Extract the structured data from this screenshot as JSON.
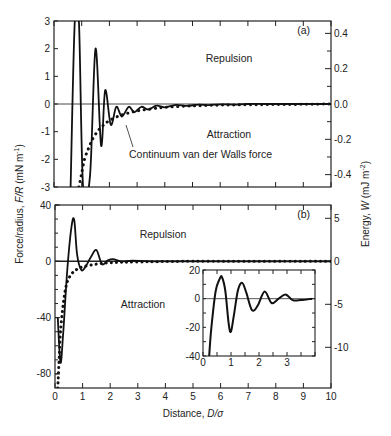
{
  "chart_data": [
    {
      "panel": "(a)",
      "type": "line",
      "xlabel": "Distance, D/σ",
      "ylabel": "Force/radius, F/R (mN m⁻¹)",
      "ylabel_right": "Energy, W (mJ m⁻²)",
      "xlim": [
        0,
        10
      ],
      "ylim": [
        -3,
        3
      ],
      "ylim_right": [
        -0.47,
        0.47
      ],
      "x_ticks": [
        0,
        1,
        2,
        3,
        4,
        5,
        6,
        7,
        8,
        9,
        10
      ],
      "y_ticks": [
        "3",
        "2",
        "1",
        "0",
        "-1",
        "-2",
        "-3"
      ],
      "y_ticks_right": [
        "0.4",
        "0.2",
        "0.0",
        "-0.2",
        "-0.4"
      ],
      "annotations": [
        "Repulsion",
        "Attraction",
        "Continuum van der Walls force"
      ],
      "series": [
        {
          "name": "Oscillatory solvation force",
          "style": "solid",
          "x": [
            0.6,
            0.75,
            0.9,
            1.05,
            1.3,
            1.5,
            1.7,
            1.85,
            2.05,
            2.25,
            2.45,
            2.7,
            2.9,
            3.15,
            3.4,
            3.7,
            4.0,
            4.4,
            4.8,
            5.2,
            5.6,
            6.0,
            6.5,
            7.0,
            8.0,
            9.0,
            10.0
          ],
          "y": [
            -3,
            3,
            3,
            -3,
            -2.6,
            2.0,
            -1.5,
            0.5,
            -0.75,
            -0.1,
            -0.45,
            -0.1,
            -0.3,
            -0.1,
            -0.2,
            -0.06,
            -0.12,
            -0.03,
            -0.07,
            -0.02,
            -0.04,
            -0.01,
            -0.02,
            0,
            0,
            0,
            0
          ]
        },
        {
          "name": "Continuum van der Walls force",
          "style": "dotted",
          "x": [
            0.9,
            1.0,
            1.1,
            1.25,
            1.4,
            1.6,
            1.8,
            2.0,
            2.3,
            2.6,
            3.0,
            3.5,
            4.0,
            5.0,
            6.0,
            7.0,
            8.0,
            9.0,
            10.0
          ],
          "y": [
            -3.0,
            -2.5,
            -2.0,
            -1.6,
            -1.25,
            -0.95,
            -0.75,
            -0.6,
            -0.45,
            -0.35,
            -0.25,
            -0.18,
            -0.12,
            -0.07,
            -0.04,
            -0.03,
            -0.02,
            -0.01,
            0
          ]
        }
      ]
    },
    {
      "panel": "(b)",
      "type": "line",
      "xlabel": "Distance, D/σ",
      "ylabel": "Force/radius, F/R (mN m⁻¹)",
      "ylabel_right": "Energy, W (mJ m⁻²)",
      "xlim": [
        0,
        10
      ],
      "ylim": [
        -90,
        40
      ],
      "x_ticks": [
        0,
        1,
        2,
        3,
        4,
        5,
        6,
        7,
        8,
        9,
        10
      ],
      "y_ticks": [
        "40",
        "0",
        "-40",
        "-80"
      ],
      "y_ticks_right": [
        "5",
        "0",
        "-5",
        "-10"
      ],
      "annotations": [
        "Repulsion",
        "Attraction"
      ],
      "series": [
        {
          "name": "Oscillatory force (total)",
          "style": "solid",
          "x": [
            0.1,
            0.2,
            0.3,
            0.45,
            0.6,
            0.7,
            0.8,
            0.95,
            1.1,
            1.3,
            1.5,
            1.7,
            1.9,
            2.1,
            2.4,
            2.8,
            3.5,
            5.0,
            10.0
          ],
          "y": [
            -40,
            -72,
            -50,
            -5,
            25,
            29,
            5,
            -6,
            -4,
            3,
            8,
            -2,
            0.5,
            1.5,
            0,
            0.5,
            0,
            0,
            0
          ]
        },
        {
          "name": "Continuum van der Walls force",
          "style": "dotted",
          "x": [
            0.1,
            0.15,
            0.2,
            0.3,
            0.4,
            0.5,
            0.7,
            1.0,
            1.5,
            2.0,
            3.0,
            5.0,
            10.0
          ],
          "y": [
            -90,
            -70,
            -50,
            -30,
            -18,
            -12,
            -7,
            -4,
            -2,
            -1,
            -0.5,
            0,
            0
          ]
        }
      ],
      "inset": {
        "type": "line",
        "xlim": [
          0,
          4
        ],
        "ylim": [
          -40,
          20
        ],
        "x_ticks": [
          "0",
          "1",
          "2",
          "3"
        ],
        "y_ticks": [
          "20",
          "0",
          "-20",
          "-40"
        ],
        "series": [
          {
            "name": "Oscillatory force (zoomed)",
            "style": "solid",
            "x": [
              0.22,
              0.3,
              0.45,
              0.6,
              0.68,
              0.8,
              0.92,
              1.0,
              1.1,
              1.25,
              1.4,
              1.55,
              1.75,
              1.95,
              2.2,
              2.45,
              2.7,
              2.95,
              3.2,
              3.5,
              3.9
            ],
            "y": [
              -40,
              -20,
              5,
              14,
              15,
              5,
              -18,
              -23,
              -12,
              6,
              11,
              4,
              -8,
              -5,
              5,
              -3,
              0,
              3,
              -1,
              -1,
              0
            ]
          }
        ]
      }
    }
  ],
  "labels": {
    "panel_a": "(a)",
    "panel_b": "(b)",
    "repulsion": "Repulsion",
    "attraction": "Attraction",
    "continuum": "Continuum van der Walls force",
    "xlabel_prefix": "Distance, ",
    "xlabel_var": "D/σ",
    "ylabel_prefix": "Force/radius, ",
    "ylabel_var": "F/R",
    "ylabel_unit": " (mN m",
    "ylabel_exp": "-1",
    "ylabel_close": ")",
    "ylabel_right_prefix": "Energy, ",
    "ylabel_right_var": "W",
    "ylabel_right_unit": " (mJ m",
    "ylabel_right_exp": "-2",
    "ylabel_right_close": ")"
  }
}
